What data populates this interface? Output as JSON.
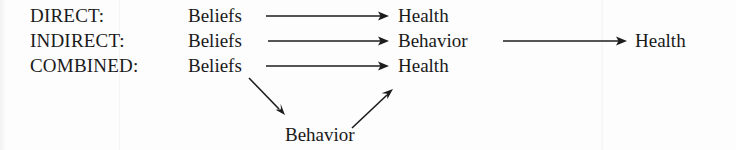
{
  "figure": {
    "kind": "causal-pathway-diagram",
    "background_color": "#fdfdfd",
    "ink_color": "#1c1c1c",
    "rows": [
      {
        "id": "direct",
        "label": "DIRECT:",
        "nodes": [
          "Beliefs",
          "Health"
        ],
        "arrows": [
          {
            "from": "Beliefs",
            "to": "Health",
            "style": "horizontal"
          }
        ]
      },
      {
        "id": "indirect",
        "label": "INDIRECT:",
        "nodes": [
          "Beliefs",
          "Behavior",
          "Health"
        ],
        "arrows": [
          {
            "from": "Beliefs",
            "to": "Behavior",
            "style": "horizontal"
          },
          {
            "from": "Behavior",
            "to": "Health",
            "style": "horizontal"
          }
        ]
      },
      {
        "id": "combined",
        "label": "COMBINED:",
        "nodes": [
          "Beliefs",
          "Health",
          "Behavior"
        ],
        "arrows": [
          {
            "from": "Beliefs",
            "to": "Health",
            "style": "horizontal"
          },
          {
            "from": "Beliefs",
            "to": "Behavior",
            "style": "diagonal-down"
          },
          {
            "from": "Behavior",
            "to": "Health",
            "style": "diagonal-up"
          }
        ]
      }
    ],
    "labels": {
      "direct": "DIRECT:",
      "indirect": "INDIRECT:",
      "combined": "COMBINED:",
      "beliefs": "Beliefs",
      "behavior": "Behavior",
      "health": "Health"
    },
    "text": {
      "row1_label": "DIRECT:",
      "row1_source": "Beliefs",
      "row1_target": "Health",
      "row2_label": "INDIRECT:",
      "row2_source": "Beliefs",
      "row2_middle": "Behavior",
      "row2_target": "Health",
      "row3_label": "COMBINED:",
      "row3_source": "Beliefs",
      "row3_target": "Health",
      "row3_mediator": "Behavior"
    }
  }
}
